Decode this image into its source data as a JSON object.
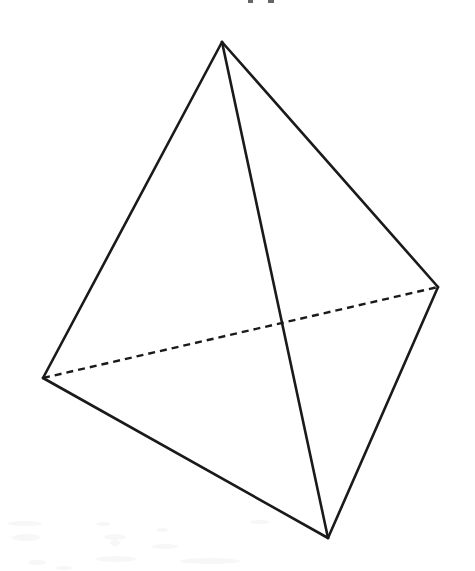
{
  "figure": {
    "canvas": {
      "width": 475,
      "height": 571,
      "background_color": "#ffffff"
    },
    "style": {
      "stroke_color": "#1a1a1a",
      "solid_stroke_width": 2.6,
      "hidden_stroke_width": 2.4,
      "hidden_dash_pattern": "7 5"
    },
    "vertices": [
      {
        "id": "apex",
        "label": "apex vertex",
        "x": 222,
        "y": 42
      },
      {
        "id": "left",
        "label": "left vertex",
        "x": 43,
        "y": 378
      },
      {
        "id": "right",
        "label": "right vertex",
        "x": 438,
        "y": 287
      },
      {
        "id": "bottom",
        "label": "bottom front vertex",
        "x": 328,
        "y": 538
      }
    ],
    "edges": [
      {
        "id": "apex-left",
        "from": "apex",
        "to": "left",
        "style": "solid",
        "visibility": "visible"
      },
      {
        "id": "apex-right",
        "from": "apex",
        "to": "right",
        "style": "solid",
        "visibility": "visible"
      },
      {
        "id": "apex-bottom",
        "from": "apex",
        "to": "bottom",
        "style": "solid",
        "visibility": "visible"
      },
      {
        "id": "left-bottom",
        "from": "left",
        "to": "bottom",
        "style": "solid",
        "visibility": "visible"
      },
      {
        "id": "bottom-right",
        "from": "bottom",
        "to": "right",
        "style": "solid",
        "visibility": "visible"
      },
      {
        "id": "left-right",
        "from": "left",
        "to": "right",
        "style": "dashed",
        "visibility": "hidden"
      }
    ]
  }
}
